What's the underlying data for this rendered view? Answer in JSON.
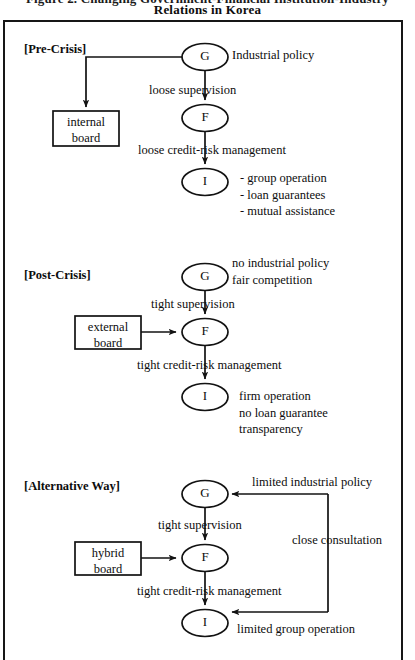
{
  "figure": {
    "title_clipped": "Figure 2. Changing Government-Financial Institution-Industry",
    "title_main": "Relations in Korea"
  },
  "sections": [
    {
      "id": "pre-crisis",
      "label": "[Pre-Crisis]",
      "nodes": {
        "g": "G",
        "f": "F",
        "i": "I"
      },
      "box": {
        "line1": "internal",
        "line2": "board"
      },
      "edge_g_to_f": "loose  supervision",
      "edge_f_to_i": "loose credit-risk management",
      "g_note": "Industrial policy",
      "i_notes": [
        "- group operation",
        "- loan guarantees",
        "- mutual assistance"
      ]
    },
    {
      "id": "post-crisis",
      "label": "[Post-Crisis]",
      "nodes": {
        "g": "G",
        "f": "F",
        "i": "I"
      },
      "box": {
        "line1": "external",
        "line2": "board"
      },
      "edge_g_to_f": "tight supervision",
      "edge_f_to_i": "tight credit-risk management",
      "g_notes": [
        "no industrial policy",
        "fair competition"
      ],
      "i_notes": [
        "firm operation",
        "no loan guarantee",
        "transparency"
      ]
    },
    {
      "id": "alternative-way",
      "label": "[Alternative Way]",
      "nodes": {
        "g": "G",
        "f": "F",
        "i": "I"
      },
      "box": {
        "line1": "hybrid",
        "line2": "board"
      },
      "edge_g_to_f": "tight supervision",
      "edge_f_to_i": "tight credit-risk management",
      "feedback_to_g": "limited industrial policy",
      "feedback_vertical": "close consultation",
      "i_note": "limited group operation"
    }
  ],
  "style": {
    "ink": "#121212",
    "paper": "#ffffff"
  }
}
